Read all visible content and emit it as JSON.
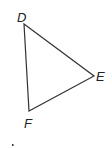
{
  "diagram": {
    "type": "triangle",
    "vertices": [
      {
        "label": "D",
        "x": 24,
        "y": 24
      },
      {
        "label": "E",
        "x": 94,
        "y": 76
      },
      {
        "label": "F",
        "x": 29,
        "y": 111
      }
    ],
    "labels": {
      "D": "D",
      "E": "E",
      "F": "F"
    },
    "stroke_color": "#333333"
  }
}
